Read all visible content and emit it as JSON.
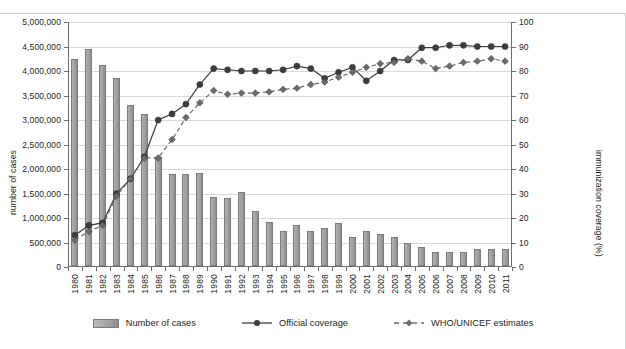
{
  "chart_data": {
    "type": "bar",
    "title": "",
    "xlabel": "",
    "ylabel": "number of cases",
    "y2label": "immunization coverage (%)",
    "ylim": [
      0,
      5000000
    ],
    "y2lim": [
      0,
      100
    ],
    "grid": true,
    "legend_position": "bottom",
    "categories": [
      "1980",
      "1981",
      "1982",
      "1983",
      "1984",
      "1985",
      "1986",
      "1987",
      "1988",
      "1989",
      "1990",
      "1991",
      "1992",
      "1993",
      "1994",
      "1995",
      "1996",
      "1997",
      "1998",
      "1999",
      "2000",
      "2001",
      "2002",
      "2003",
      "2004",
      "2005",
      "2006",
      "2007",
      "2008",
      "2009",
      "2010",
      "2011"
    ],
    "y_ticks": [
      "0",
      "500,000",
      "1,000,000",
      "1,500,000",
      "2,000,000",
      "2,500,000",
      "3,000,000",
      "3,500,000",
      "4,000,000",
      "4,500,000",
      "5,000,000"
    ],
    "y2_ticks": [
      "0",
      "10",
      "20",
      "30",
      "40",
      "50",
      "60",
      "70",
      "80",
      "90",
      "100"
    ],
    "series": [
      {
        "name": "Number of cases",
        "type": "bar",
        "axis": "left",
        "color": "#9b9b9b",
        "values": [
          4220000,
          4430000,
          4100000,
          3840000,
          3290000,
          3100000,
          2230000,
          1880000,
          1870000,
          1890000,
          1410000,
          1390000,
          1510000,
          1130000,
          890000,
          720000,
          840000,
          720000,
          780000,
          870000,
          600000,
          720000,
          650000,
          600000,
          470000,
          390000,
          290000,
          280000,
          280000,
          350000,
          340000,
          350000
        ]
      },
      {
        "name": "Official coverage",
        "type": "line",
        "axis": "right",
        "color": "#3d3d3d",
        "marker": "circle",
        "dash": false,
        "values": [
          13,
          17,
          18,
          30,
          36,
          45,
          60,
          62.5,
          66.5,
          74.5,
          81,
          80.5,
          80,
          80,
          80,
          80.5,
          82,
          81,
          77,
          79.5,
          81.5,
          76,
          80,
          84.5,
          84.5,
          89.5,
          89.5,
          90.5,
          90.5,
          90,
          90,
          90
        ]
      },
      {
        "name": "WHO/UNICEF estimates",
        "type": "line",
        "axis": "right",
        "color": "#6b6b6b",
        "marker": "diamond",
        "dash": true,
        "values": [
          11,
          14.5,
          17,
          29,
          36,
          44.5,
          44.5,
          52,
          61,
          67,
          72,
          70.5,
          71,
          71,
          71.5,
          72.5,
          73,
          74.5,
          75.5,
          77.5,
          79.5,
          81.5,
          83,
          83.5,
          85,
          84,
          81,
          82,
          83.5,
          84,
          85,
          84
        ]
      }
    ]
  },
  "legend": {
    "items": [
      {
        "label": "Number of cases",
        "style": "bar"
      },
      {
        "label": "Official coverage",
        "style": "line-circle"
      },
      {
        "label": "WHO/UNICEF estimates",
        "style": "line-diamond-dashed"
      }
    ]
  }
}
